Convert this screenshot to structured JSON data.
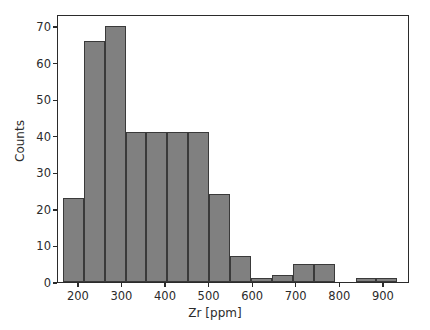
{
  "chart_data": {
    "type": "bar",
    "title": "",
    "xlabel": "Zr [ppm]",
    "ylabel": "Counts",
    "xlim": [
      152,
      960
    ],
    "ylim": [
      0,
      73.3
    ],
    "xticks": [
      200,
      300,
      400,
      500,
      600,
      700,
      800,
      900
    ],
    "xticklabels": [
      "200",
      "300",
      "400",
      "500",
      "600",
      "700",
      "800",
      "900"
    ],
    "yticks": [
      0,
      10,
      20,
      30,
      40,
      50,
      60,
      70
    ],
    "yticklabels": [
      "0",
      "10",
      "20",
      "30",
      "40",
      "50",
      "60",
      "70"
    ],
    "grid": false,
    "legend": null,
    "bin_width": 48,
    "bin_edges": [
      163,
      211,
      259,
      307,
      355,
      403,
      451,
      499,
      547,
      595,
      643,
      691,
      739,
      787,
      835,
      883,
      931
    ],
    "categories": [
      "163-211",
      "211-259",
      "259-307",
      "307-355",
      "355-403",
      "403-451",
      "451-499",
      "499-547",
      "547-595",
      "595-643",
      "643-691",
      "691-739",
      "739-787",
      "787-835",
      "835-883",
      "883-931"
    ],
    "values": [
      23,
      66,
      70,
      41,
      41,
      41,
      41,
      24,
      7,
      1,
      2,
      5,
      5,
      0,
      1,
      1
    ],
    "bar_color": "#808080",
    "bar_edge_color": "#3a3a3a",
    "background_color": "#ffffff",
    "axis_color": "#2b2b2b"
  }
}
